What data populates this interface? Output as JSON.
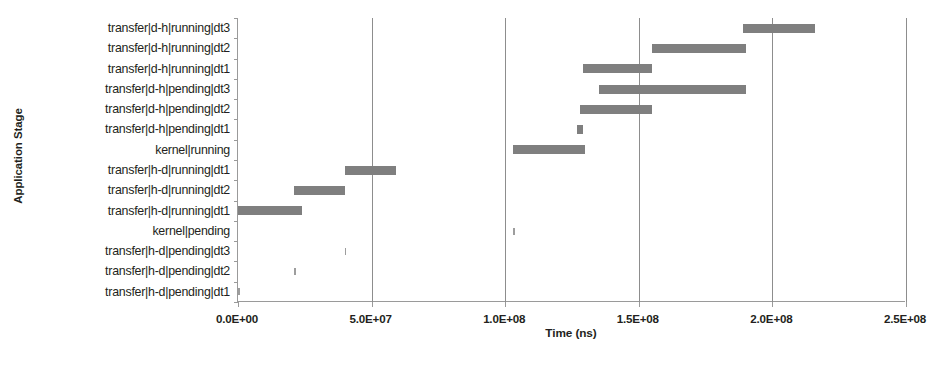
{
  "chart_data": {
    "type": "bar",
    "orientation": "horizontal",
    "subtype": "gantt",
    "title": "",
    "xlabel": "Time (ns)",
    "ylabel": "Application Stage",
    "xlim": [
      0,
      250000000
    ],
    "ylim": [
      0,
      14
    ],
    "grid": "vertical",
    "legend": "none",
    "bar_color": "#7f7f7f",
    "xticks": [
      0,
      50000000,
      100000000,
      150000000,
      200000000,
      250000000
    ],
    "xticklabels": [
      "0.0E+00",
      "5.0E+07",
      "1.0E+08",
      "1.5E+08",
      "2.0E+08",
      "2.5E+08"
    ],
    "categories": [
      "transfer|d-h|running|dt3",
      "transfer|d-h|running|dt2",
      "transfer|d-h|running|dt1",
      "transfer|d-h|pending|dt3",
      "transfer|d-h|pending|dt2",
      "transfer|d-h|pending|dt1",
      "kernel|running",
      "transfer|h-d|running|dt1",
      "transfer|h-d|running|dt2",
      "transfer|h-d|running|dt1",
      "kernel|pending",
      "transfer|h-d|pending|dt3",
      "transfer|h-d|pending|dt2",
      "transfer|h-d|pending|dt1"
    ],
    "bars": [
      {
        "category": "transfer|d-h|running|dt3",
        "start": 189000000,
        "end": 216000000,
        "duration": 27000000
      },
      {
        "category": "transfer|d-h|running|dt2",
        "start": 155000000,
        "end": 190000000,
        "duration": 35000000
      },
      {
        "category": "transfer|d-h|running|dt1",
        "start": 129000000,
        "end": 155000000,
        "duration": 26000000
      },
      {
        "category": "transfer|d-h|pending|dt3",
        "start": 135000000,
        "end": 190000000,
        "duration": 55000000
      },
      {
        "category": "transfer|d-h|pending|dt2",
        "start": 128000000,
        "end": 155000000,
        "duration": 27000000
      },
      {
        "category": "transfer|d-h|pending|dt1",
        "start": 127000000,
        "end": 129000000,
        "duration": 2000000
      },
      {
        "category": "kernel|running",
        "start": 103000000,
        "end": 130000000,
        "duration": 27000000
      },
      {
        "category": "transfer|h-d|running|dt1",
        "start": 40000000,
        "end": 59000000,
        "duration": 19000000
      },
      {
        "category": "transfer|h-d|running|dt2",
        "start": 21000000,
        "end": 40000000,
        "duration": 19000000
      },
      {
        "category": "transfer|h-d|running|dt1",
        "start": 0,
        "end": 24000000,
        "duration": 24000000
      },
      {
        "category": "kernel|pending",
        "start": 103000000,
        "end": 103500000,
        "duration": 500000
      },
      {
        "category": "transfer|h-d|pending|dt3",
        "start": 40000000,
        "end": 40500000,
        "duration": 500000
      },
      {
        "category": "transfer|h-d|pending|dt2",
        "start": 21000000,
        "end": 21500000,
        "duration": 500000
      },
      {
        "category": "transfer|h-d|pending|dt1",
        "start": 0,
        "end": 500000,
        "duration": 500000
      }
    ]
  }
}
